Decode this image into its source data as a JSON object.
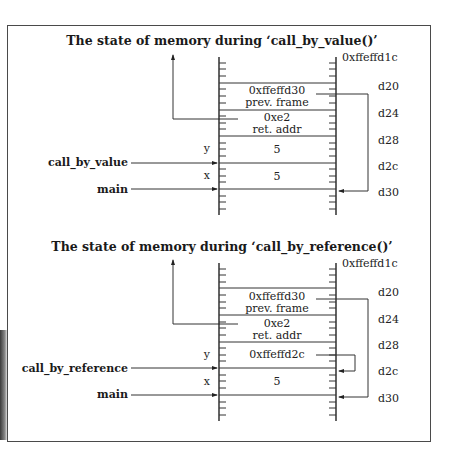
{
  "figure": {
    "diagrams": [
      {
        "title": "The state of memory during ‘call_by_value()’",
        "top_address": "0xffeffd1c",
        "addresses": [
          "d20",
          "d24",
          "d28",
          "d2c",
          "d30"
        ],
        "cells": [
          {
            "line1": "0xffeffd30",
            "line2": "prev. frame"
          },
          {
            "line1": "0xe2",
            "line2": "ret. addr"
          },
          {
            "line1": "5",
            "line2": "",
            "var": "y"
          },
          {
            "line1": "5",
            "line2": "",
            "var": "x"
          }
        ],
        "frame_labels": [
          {
            "label": "call_by_value"
          },
          {
            "label": "main"
          }
        ],
        "pointer_arrows": [
          {
            "from": "prev. frame",
            "to": "d30"
          }
        ]
      },
      {
        "title": "The state of memory during ‘call_by_reference()’",
        "top_address": "0xffeffd1c",
        "addresses": [
          "d20",
          "d24",
          "d28",
          "d2c",
          "d30"
        ],
        "cells": [
          {
            "line1": "0xffeffd30",
            "line2": "prev. frame"
          },
          {
            "line1": "0xe2",
            "line2": "ret. addr"
          },
          {
            "line1": "0xffeffd2c",
            "line2": "",
            "var": "y"
          },
          {
            "line1": "5",
            "line2": "",
            "var": "x"
          }
        ],
        "frame_labels": [
          {
            "label": "call_by_reference"
          },
          {
            "label": "main"
          }
        ],
        "pointer_arrows": [
          {
            "from": "prev. frame",
            "to": "d30"
          },
          {
            "from": "y",
            "to": "d2c"
          }
        ]
      }
    ]
  }
}
